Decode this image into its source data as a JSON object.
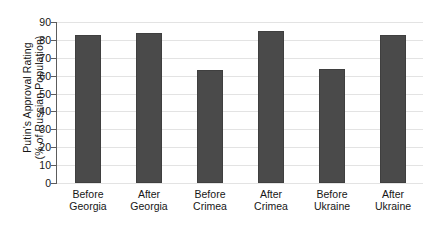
{
  "chart_data": {
    "type": "bar",
    "title": "",
    "xlabel": "",
    "ylabel_line1": "Putin's Approval Rating",
    "ylabel_line2": "(% of Russian Population)",
    "categories": [
      "Before Georgia",
      "After Georgia",
      "Before Crimea",
      "After Crimea",
      "Before Ukraine",
      "After Ukraine"
    ],
    "category_lines": [
      [
        "Before",
        "Georgia"
      ],
      [
        "After",
        "Georgia"
      ],
      [
        "Before",
        "Crimea"
      ],
      [
        "After",
        "Crimea"
      ],
      [
        "Before",
        "Ukraine"
      ],
      [
        "After",
        "Ukraine"
      ]
    ],
    "values": [
      83,
      84,
      63,
      85,
      64,
      83
    ],
    "ylim": [
      0,
      90
    ],
    "yticks": [
      0,
      10,
      20,
      30,
      40,
      50,
      60,
      70,
      80,
      90
    ],
    "ytick_labels": [
      "0",
      "10",
      "20",
      "30",
      "40",
      "50",
      "60",
      "70",
      "80",
      "90"
    ],
    "grid": true,
    "legend": "none",
    "bar_color": "#4a4a4a",
    "background_color": "#ffffff",
    "axis_color": "#5c5c5c",
    "gridline_color": "#e3e3e3"
  }
}
